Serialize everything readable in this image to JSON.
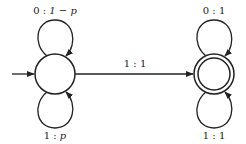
{
  "diagram": {
    "type": "finite-state-automaton",
    "colors": {
      "stroke": "#222222",
      "background": "#ffffff"
    },
    "states": [
      {
        "id": "q0",
        "initial": true,
        "accepting": false
      },
      {
        "id": "q1",
        "initial": false,
        "accepting": true
      }
    ],
    "transitions": [
      {
        "from": "q0",
        "to": "q0",
        "position": "top",
        "label_symbol": "0",
        "label_sep": ":",
        "label_weight": "1 − p",
        "label": "0 : 1 − p"
      },
      {
        "from": "q0",
        "to": "q0",
        "position": "bottom",
        "label_symbol": "1",
        "label_sep": ":",
        "label_weight": "p",
        "label": "1 : p"
      },
      {
        "from": "q0",
        "to": "q1",
        "position": "middle",
        "label_symbol": "1",
        "label_sep": ":",
        "label_weight": "1",
        "label": "1 : 1"
      },
      {
        "from": "q1",
        "to": "q1",
        "position": "top",
        "label_symbol": "0",
        "label_sep": ":",
        "label_weight": "1",
        "label": "0 : 1"
      },
      {
        "from": "q1",
        "to": "q1",
        "position": "bottom",
        "label_symbol": "1",
        "label_sep": ":",
        "label_weight": "1",
        "label": "1 : 1"
      }
    ]
  }
}
